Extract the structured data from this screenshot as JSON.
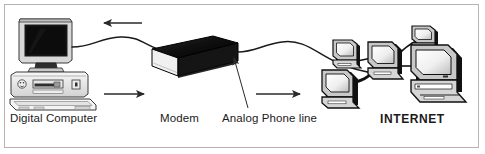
{
  "figure": {
    "width": 485,
    "height": 154,
    "background_color": "#ffffff",
    "border_color": "#b4b4b4"
  },
  "labels": {
    "digital_computer": "Digital Computer",
    "modem": "Modem",
    "analog_phone_line": "Analog Phone line",
    "internet": "INTERNET"
  },
  "nodes": [
    {
      "id": "digital-computer",
      "name": "Digital Computer",
      "type": "desktop-computer",
      "screen_color": "#141414",
      "case_color": "#f2f2f2",
      "outline_color": "#3a3a3a"
    },
    {
      "id": "modem",
      "name": "Modem",
      "type": "modem-box",
      "body_color": "#111111",
      "front_color": "#f5f5f5",
      "outline_color": "#000000"
    },
    {
      "id": "internet-cluster",
      "name": "INTERNET",
      "type": "computer-cluster",
      "computer_count": 5,
      "screen_color": "#e8e8e8",
      "case_color": "#d0d0d0",
      "outline_color": "#111111"
    }
  ],
  "connections": [
    {
      "id": "computer-to-modem",
      "from": "digital-computer",
      "to": "modem",
      "style": "curved-cable",
      "color": "#1a1a1a"
    },
    {
      "id": "modem-to-internet",
      "from": "modem",
      "to": "internet-cluster",
      "style": "curved-cable",
      "label": "Analog Phone line",
      "color": "#1a1a1a"
    }
  ],
  "arrows": [
    {
      "id": "arrow-top-inbound",
      "direction": "left",
      "meaning": "data flowing back to the digital computer"
    },
    {
      "id": "arrow-computer-to-modem",
      "direction": "right",
      "meaning": "digital data flowing toward the modem"
    },
    {
      "id": "arrow-modem-to-internet",
      "direction": "right",
      "meaning": "analog signal flowing toward the Internet"
    },
    {
      "id": "arrow-phone-line-pointer",
      "direction": "up-left",
      "meaning": "callout pointing at the analog phone line cable"
    }
  ],
  "colors": {
    "ink": "#1b1b1b",
    "cable": "#1a1a1a",
    "dark_fill": "#111111",
    "light_fill": "#f2f2f2",
    "mid_gray": "#c8c8c8",
    "border": "#b4b4b4"
  }
}
